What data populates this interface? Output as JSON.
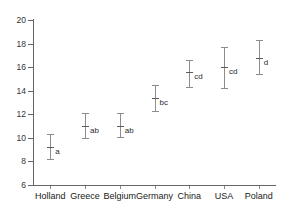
{
  "chart_data": {
    "type": "scatter",
    "title": "",
    "subtitle": "",
    "xlabel": "",
    "ylabel": "",
    "categories": [
      "Holland",
      "Greece",
      "Belgium",
      "Germany",
      "China",
      "USA",
      "Poland"
    ],
    "values": [
      9.2,
      11.0,
      11.0,
      13.4,
      15.6,
      16.0,
      16.8
    ],
    "errors_low": [
      8.2,
      10.0,
      10.1,
      12.3,
      14.3,
      14.2,
      15.4
    ],
    "errors_high": [
      10.3,
      12.1,
      12.1,
      14.5,
      16.6,
      17.7,
      18.3
    ],
    "annotations": [
      "a",
      "ab",
      "ab",
      "bc",
      "cd",
      "cd",
      "d"
    ],
    "ylim": [
      6,
      20
    ],
    "yticks": [
      6,
      8,
      10,
      12,
      14,
      16,
      18,
      20
    ],
    "ytick_labels": [
      "6",
      "8",
      "10",
      "12",
      "14",
      "16",
      "18",
      "20"
    ],
    "grid": false,
    "legend": "none",
    "marker_color": "#8c8c8c",
    "axis_color": "#666666",
    "text_color": "#1a1a1a",
    "background": "#ffffff"
  },
  "points": [
    {
      "category": "Holland",
      "mean": 9.2,
      "low": 8.2,
      "high": 10.3,
      "letter": "a"
    },
    {
      "category": "Greece",
      "mean": 11.0,
      "low": 10.0,
      "high": 12.1,
      "letter": "ab"
    },
    {
      "category": "Belgium",
      "mean": 11.0,
      "low": 10.1,
      "high": 12.1,
      "letter": "ab"
    },
    {
      "category": "Germany",
      "mean": 13.4,
      "low": 12.3,
      "high": 14.5,
      "letter": "bc"
    },
    {
      "category": "China",
      "mean": 15.6,
      "low": 14.3,
      "high": 16.6,
      "letter": "cd"
    },
    {
      "category": "USA",
      "mean": 16.0,
      "low": 14.2,
      "high": 17.7,
      "letter": "cd"
    },
    {
      "category": "Poland",
      "mean": 16.8,
      "low": 15.4,
      "high": 18.3,
      "letter": "d"
    }
  ]
}
